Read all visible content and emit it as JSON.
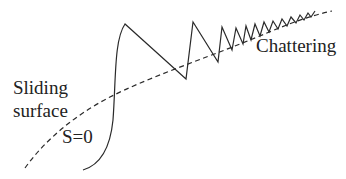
{
  "diagram": {
    "labels": {
      "chattering": "Chattering",
      "sliding": "Sliding",
      "surface": "surface",
      "surface_equation": "S=0"
    },
    "colors": {
      "line": "#2a2a2a",
      "text": "#222222",
      "background": "#ffffff"
    },
    "elements": {
      "sliding_surface": {
        "style": "dashed",
        "description": "Curved dashed line representing the sliding surface S=0"
      },
      "trajectory": {
        "style": "solid",
        "description": "System state trajectory reaching surface and oscillating with decreasing amplitude (chattering)"
      }
    }
  }
}
